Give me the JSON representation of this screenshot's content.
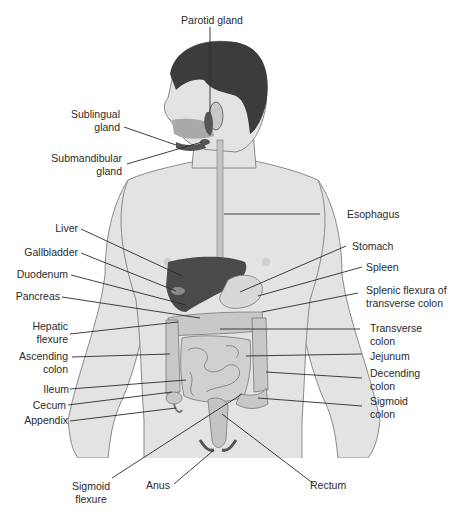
{
  "diagram": {
    "colors": {
      "skin": "#e3e3e3",
      "skin_outline": "#8a8a8a",
      "hair": "#3c3c3c",
      "liver": "#4a4a4a",
      "organ_light": "#d2d2d2",
      "organ_mid": "#a9a9a9",
      "leader_line": "#2a2a2a",
      "text": "#2a2a2a"
    },
    "labels": {
      "parotid_gland": "Parotid gland",
      "sublingual_gland_1": "Sublingual",
      "sublingual_gland_2": "gland",
      "submandibular_gland_1": "Submandibular",
      "submandibular_gland_2": "gland",
      "esophagus": "Esophagus",
      "liver": "Liver",
      "gallbladder": "Gallbladder",
      "duodenum": "Duodenum",
      "pancreas": "Pancreas",
      "stomach": "Stomach",
      "spleen": "Spleen",
      "splenic_flexura_1": "Splenic flexura of",
      "splenic_flexura_2": "transverse colon",
      "hepatic_flexure_1": "Hepatic",
      "hepatic_flexure_2": "flexure",
      "transverse_colon_1": "Transverse",
      "transverse_colon_2": "colon",
      "ascending_colon_1": "Ascending",
      "ascending_colon_2": "colon",
      "jejunum": "Jejunum",
      "ileum": "Ileum",
      "decending_colon_1": "Decending",
      "decending_colon_2": "colon",
      "cecum": "Cecum",
      "sigmoid_colon_1": "Sigmoid",
      "sigmoid_colon_2": "colon",
      "appendix": "Appendix",
      "sigmoid_flexure_1": "Sigmoid",
      "sigmoid_flexure_2": "flexure",
      "anus": "Anus",
      "rectum": "Rectum"
    }
  }
}
